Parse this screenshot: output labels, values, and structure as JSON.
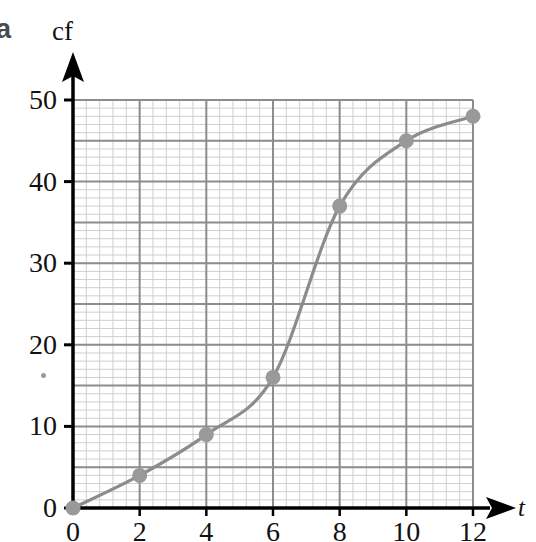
{
  "figure": {
    "part_label": "a",
    "speck_marks": [
      {
        "x": 41,
        "y": 373
      }
    ]
  },
  "chart_data": {
    "type": "line",
    "title": "",
    "xlabel": "t",
    "ylabel": "cf",
    "x": [
      0,
      2,
      4,
      6,
      8,
      10,
      12
    ],
    "values": [
      0,
      4,
      9,
      16,
      37,
      45,
      48
    ],
    "series": [
      {
        "name": "cumulative frequency",
        "x": [
          0,
          2,
          4,
          6,
          8,
          10,
          12
        ],
        "values": [
          0,
          4,
          9,
          16,
          37,
          45,
          48
        ]
      }
    ],
    "xlim": [
      0,
      12
    ],
    "ylim": [
      0,
      50
    ],
    "xticks": [
      0,
      2,
      4,
      6,
      8,
      10,
      12
    ],
    "xtick_labels": [
      "0",
      "2",
      "4",
      "6",
      "8",
      "10",
      "12"
    ],
    "yticks": [
      0,
      10,
      20,
      30,
      40,
      50
    ],
    "ytick_labels": [
      "0",
      "10",
      "20",
      "30",
      "40",
      "50"
    ],
    "grid": true,
    "grid_major_x_step": 2,
    "grid_major_y_step": 5,
    "grid_minor_divisions": 5,
    "legend": "none",
    "marker": "circle",
    "curve_style": "smooth",
    "colors": {
      "curve": "#8c8c8c",
      "marker": "#999999",
      "grid_major": "#8d8d8d",
      "grid_minor": "#cfcfcf",
      "axis": "#000000",
      "text": "#111111",
      "part_label": "#4a4a4a",
      "background": "#ffffff"
    }
  },
  "geometry": {
    "plot_left": 73,
    "plot_right": 473,
    "plot_top": 100,
    "plot_bottom": 508,
    "y_axis_top": 52,
    "x_axis_right": 516
  }
}
